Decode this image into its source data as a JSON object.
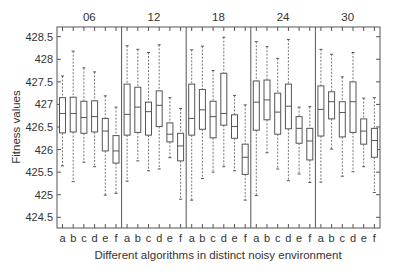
{
  "chart_data": {
    "type": "boxplot",
    "title": "",
    "xlabel": "Different algorithms in distinct noisy environment",
    "ylabel": "Fitness values",
    "ylim": [
      424.25,
      428.7
    ],
    "yticks": [
      424.5,
      425,
      425.5,
      426,
      426.5,
      427,
      427.5,
      428,
      428.5
    ],
    "ytick_labels": [
      "424.5",
      "425",
      "425.5",
      "426",
      "426.5",
      "427",
      "427.5",
      "428",
      "428.5"
    ],
    "grid": false,
    "categories": [
      "a",
      "b",
      "c",
      "d",
      "e",
      "f"
    ],
    "panels": [
      {
        "label": "06",
        "boxes": [
          {
            "category": "a",
            "whisker_low": 425.64,
            "q1": 426.37,
            "median": 426.8,
            "q3": 427.15,
            "whisker_high": 427.63
          },
          {
            "category": "b",
            "whisker_low": 425.29,
            "q1": 426.39,
            "median": 426.8,
            "q3": 427.16,
            "whisker_high": 428.18
          },
          {
            "category": "c",
            "whisker_low": 425.72,
            "q1": 426.36,
            "median": 426.71,
            "q3": 427.07,
            "whisker_high": 427.81
          },
          {
            "category": "d",
            "whisker_low": 425.62,
            "q1": 426.39,
            "median": 426.73,
            "q3": 427.08,
            "whisker_high": 427.72
          },
          {
            "category": "e",
            "whisker_low": 424.99,
            "q1": 425.97,
            "median": 426.41,
            "q3": 426.69,
            "whisker_high": 427.19
          },
          {
            "category": "f",
            "whisker_low": 425.03,
            "q1": 425.7,
            "median": 425.97,
            "q3": 426.31,
            "whisker_high": 426.94
          }
        ]
      },
      {
        "label": "12",
        "boxes": [
          {
            "category": "a",
            "whisker_low": 425.3,
            "q1": 426.32,
            "median": 426.78,
            "q3": 427.45,
            "whisker_high": 428.3
          },
          {
            "category": "b",
            "whisker_low": 425.75,
            "q1": 426.38,
            "median": 426.94,
            "q3": 427.38,
            "whisker_high": 428.22
          },
          {
            "category": "c",
            "whisker_low": 425.53,
            "q1": 426.32,
            "median": 426.84,
            "q3": 427.05,
            "whisker_high": 428.15
          },
          {
            "category": "d",
            "whisker_low": 425.57,
            "q1": 426.51,
            "median": 426.98,
            "q3": 427.3,
            "whisker_high": 428.32
          },
          {
            "category": "e",
            "whisker_low": 425.82,
            "q1": 426.17,
            "median": 426.34,
            "q3": 426.59,
            "whisker_high": 427.15
          },
          {
            "category": "f",
            "whisker_low": 424.9,
            "q1": 425.75,
            "median": 426.08,
            "q3": 426.36,
            "whisker_high": 426.91
          }
        ]
      },
      {
        "label": "18",
        "boxes": [
          {
            "category": "a",
            "whisker_low": 424.88,
            "q1": 426.32,
            "median": 426.69,
            "q3": 427.45,
            "whisker_high": 428.21
          },
          {
            "category": "b",
            "whisker_low": 425.36,
            "q1": 426.45,
            "median": 426.88,
            "q3": 427.33,
            "whisker_high": 428.29
          },
          {
            "category": "c",
            "whisker_low": 425.5,
            "q1": 426.26,
            "median": 426.73,
            "q3": 427.07,
            "whisker_high": 427.75
          },
          {
            "category": "d",
            "whisker_low": 425.62,
            "q1": 426.54,
            "median": 426.8,
            "q3": 427.69,
            "whisker_high": 428.49
          },
          {
            "category": "e",
            "whisker_low": 425.53,
            "q1": 426.25,
            "median": 426.51,
            "q3": 426.77,
            "whisker_high": 427.2
          },
          {
            "category": "f",
            "whisker_low": 424.88,
            "q1": 425.45,
            "median": 425.83,
            "q3": 426.12,
            "whisker_high": 426.99
          }
        ]
      },
      {
        "label": "24",
        "boxes": [
          {
            "category": "a",
            "whisker_low": 424.98,
            "q1": 426.43,
            "median": 427.05,
            "q3": 427.52,
            "whisker_high": 428.39
          },
          {
            "category": "b",
            "whisker_low": 425.93,
            "q1": 426.66,
            "median": 427.1,
            "q3": 427.54,
            "whisker_high": 428.28
          },
          {
            "category": "c",
            "whisker_low": 425.57,
            "q1": 426.34,
            "median": 426.83,
            "q3": 427.25,
            "whisker_high": 428.02
          },
          {
            "category": "d",
            "whisker_low": 425.31,
            "q1": 426.46,
            "median": 426.96,
            "q3": 427.45,
            "whisker_high": 428.44
          },
          {
            "category": "e",
            "whisker_low": 425.46,
            "q1": 426.14,
            "median": 426.47,
            "q3": 426.73,
            "whisker_high": 426.94
          },
          {
            "category": "f",
            "whisker_low": 425.27,
            "q1": 425.77,
            "median": 426.19,
            "q3": 426.47,
            "whisker_high": 426.95
          }
        ]
      },
      {
        "label": "30",
        "boxes": [
          {
            "category": "a",
            "whisker_low": 425.28,
            "q1": 426.3,
            "median": 426.89,
            "q3": 427.41,
            "whisker_high": 428.22
          },
          {
            "category": "b",
            "whisker_low": 426.01,
            "q1": 426.68,
            "median": 427.06,
            "q3": 427.28,
            "whisker_high": 428.11
          },
          {
            "category": "c",
            "whisker_low": 425.41,
            "q1": 426.28,
            "median": 426.82,
            "q3": 427.06,
            "whisker_high": 427.61
          },
          {
            "category": "d",
            "whisker_low": 425.51,
            "q1": 426.38,
            "median": 427.06,
            "q3": 427.5,
            "whisker_high": 428.15
          },
          {
            "category": "e",
            "whisker_low": 425.62,
            "q1": 426.12,
            "median": 426.41,
            "q3": 426.68,
            "whisker_high": 427.14
          },
          {
            "category": "f",
            "whisker_low": 425.05,
            "q1": 425.83,
            "median": 426.2,
            "q3": 426.47,
            "whisker_high": 427.15
          }
        ]
      }
    ]
  },
  "colors": {
    "line": "#555555",
    "frame": "#555555",
    "text": "#333333",
    "background": "#ffffff"
  }
}
